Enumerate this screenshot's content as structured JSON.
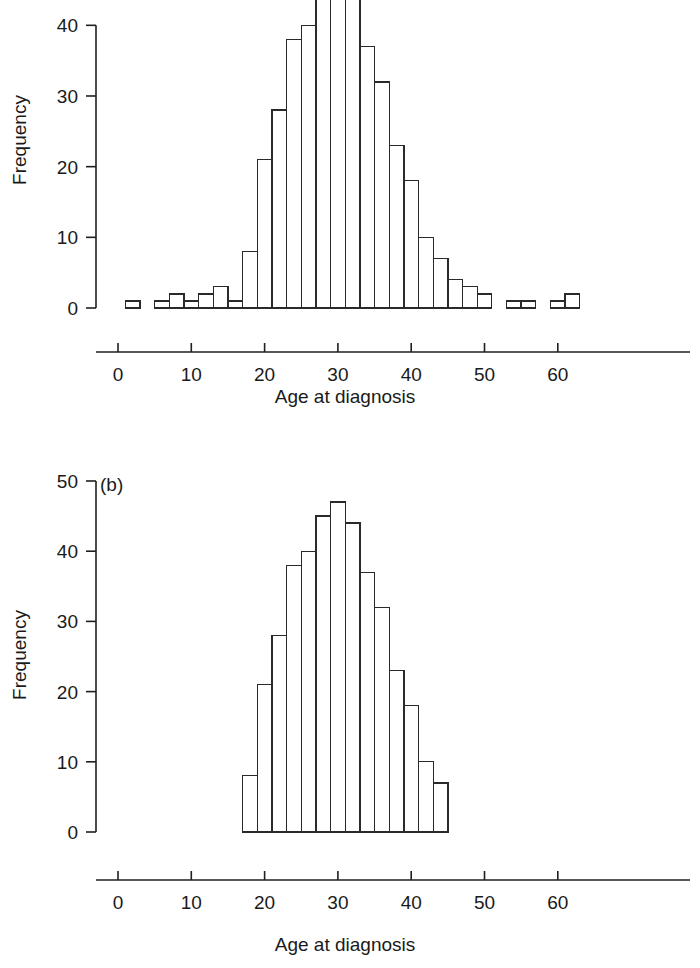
{
  "figure": {
    "background": "#ffffff",
    "ink_color": "#2a2a2a",
    "bar_fill": "#ffffff"
  },
  "panel_a": {
    "tag": "",
    "ylabel": "Frequency",
    "xlabel": "Age at diagnosis",
    "yticks": [
      "0",
      "10",
      "20",
      "30",
      "40"
    ],
    "xticks": [
      "0",
      "10",
      "20",
      "30",
      "40",
      "50",
      "60"
    ]
  },
  "panel_b": {
    "tag": "(b)",
    "ylabel": "Frequency",
    "xlabel": "Age at diagnosis",
    "yticks": [
      "0",
      "10",
      "20",
      "30",
      "40",
      "50"
    ],
    "xticks": [
      "0",
      "10",
      "20",
      "30",
      "40",
      "50",
      "60"
    ]
  },
  "chart_data": [
    {
      "type": "bar",
      "id": "panel-a-histogram",
      "title": "",
      "panel_tag": "",
      "xlabel": "Age at diagnosis",
      "ylabel": "Frequency",
      "xlim": [
        0,
        65
      ],
      "ylim": [
        0,
        43.5
      ],
      "y_axis_note": "panel is cropped at the top; bars taller than about 43 are clipped by the image edge",
      "ytick_values": [
        0,
        10,
        20,
        30,
        40
      ],
      "ytick_labels": [
        "0",
        "10",
        "20",
        "30",
        "40"
      ],
      "xtick_values": [
        0,
        10,
        20,
        30,
        40,
        50,
        60
      ],
      "xtick_labels": [
        "0",
        "10",
        "20",
        "30",
        "40",
        "50",
        "60"
      ],
      "grid": false,
      "legend": null,
      "bin_width": 2,
      "bin_starts": [
        1,
        5,
        7,
        9,
        11,
        13,
        15,
        17,
        19,
        21,
        23,
        25,
        27,
        29,
        31,
        33,
        35,
        37,
        39,
        41,
        43,
        45,
        47,
        49,
        53,
        55,
        59,
        61
      ],
      "values": [
        1,
        1,
        2,
        1,
        2,
        3,
        1,
        8,
        21,
        28,
        38,
        40,
        45,
        47,
        44,
        37,
        32,
        23,
        18,
        10,
        7,
        4,
        3,
        2,
        1,
        1,
        1,
        2
      ]
    },
    {
      "type": "bar",
      "id": "panel-b-histogram",
      "title": "",
      "panel_tag": "(b)",
      "xlabel": "Age at diagnosis",
      "ylabel": "Frequency",
      "xlim": [
        0,
        65
      ],
      "ylim": [
        0,
        50
      ],
      "ytick_values": [
        0,
        10,
        20,
        30,
        40,
        50
      ],
      "ytick_labels": [
        "0",
        "10",
        "20",
        "30",
        "40",
        "50"
      ],
      "xtick_values": [
        0,
        10,
        20,
        30,
        40,
        50,
        60
      ],
      "xtick_labels": [
        "0",
        "10",
        "20",
        "30",
        "40",
        "50",
        "60"
      ],
      "grid": false,
      "legend": null,
      "bin_width": 2,
      "bin_starts": [
        17,
        19,
        21,
        23,
        25,
        27,
        29,
        31,
        33,
        35,
        37,
        39,
        41,
        43
      ],
      "values": [
        8,
        21,
        28,
        38,
        40,
        45,
        47,
        44,
        37,
        32,
        23,
        18,
        10,
        7
      ]
    }
  ]
}
